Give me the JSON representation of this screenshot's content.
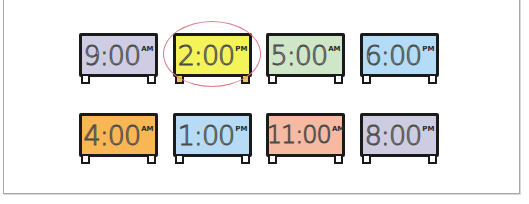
{
  "clocks": [
    {
      "time": "9:00",
      "period": "AM",
      "color": "#cfcde3",
      "row": 0,
      "col": 0,
      "selected": false
    },
    {
      "time": "2:00",
      "period": "PM",
      "color": "#f4f35a",
      "row": 0,
      "col": 1,
      "selected": true
    },
    {
      "time": "5:00",
      "period": "AM",
      "color": "#cfe6c9",
      "row": 0,
      "col": 2,
      "selected": false
    },
    {
      "time": "6:00",
      "period": "PM",
      "color": "#b4dcf6",
      "row": 0,
      "col": 3,
      "selected": false
    },
    {
      "time": "4:00",
      "period": "AM",
      "color": "#f9b654",
      "row": 1,
      "col": 0,
      "selected": false
    },
    {
      "time": "1:00",
      "period": "PM",
      "color": "#b8dbf5",
      "row": 1,
      "col": 1,
      "selected": false
    },
    {
      "time": "11:00",
      "period": "AM",
      "color": "#f6b9a1",
      "row": 1,
      "col": 2,
      "selected": false
    },
    {
      "time": "8:00",
      "period": "PM",
      "color": "#cdcce0",
      "row": 1,
      "col": 3,
      "selected": false
    }
  ],
  "colors": {
    "highlight": "#e07a86",
    "outline": "#1a1a1a",
    "frame_border": "#a8a8a8"
  }
}
